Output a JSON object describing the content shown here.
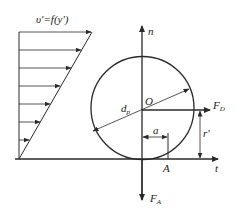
{
  "figure": {
    "stroke_color": "#2a2a2a",
    "background": "#ffffff",
    "velocity_profile_label": "υ'=f(y')",
    "circle_center_label": "O",
    "diameter_label": "d",
    "diameter_subscript": "p",
    "normal_axis_label": "n",
    "tangent_axis_label": "t",
    "drag_force_label": "F",
    "drag_force_subscript": "D",
    "contact_force_label": "F",
    "contact_force_subscript": "A",
    "offset_label": "a",
    "height_label": "r'",
    "contact_point_label": "A"
  }
}
